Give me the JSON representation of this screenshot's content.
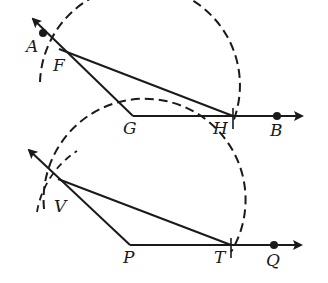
{
  "figures": [
    {
      "name": "top-construction",
      "points": {
        "A": {
          "label": "A",
          "x": 43,
          "y": 33
        },
        "F": {
          "label": "F",
          "x": 59,
          "y": 49
        },
        "G": {
          "label": "G",
          "x": 133,
          "y": 116
        },
        "H": {
          "label": "H",
          "x": 233,
          "y": 116
        },
        "B": {
          "label": "B",
          "x": 277,
          "y": 116
        }
      },
      "arc_center": "G",
      "arc_radius": 100
    },
    {
      "name": "bottom-construction",
      "points": {
        "V": {
          "label": "V",
          "x": 58,
          "y": 179
        },
        "P": {
          "label": "P",
          "x": 130,
          "y": 245
        },
        "T": {
          "label": "T",
          "x": 231,
          "y": 245
        },
        "Q": {
          "label": "Q",
          "x": 274,
          "y": 245
        }
      },
      "arc_center": "P",
      "arc_radius": 101
    }
  ],
  "colors": {
    "stroke": "#1a1a1a",
    "background": "#ffffff"
  }
}
